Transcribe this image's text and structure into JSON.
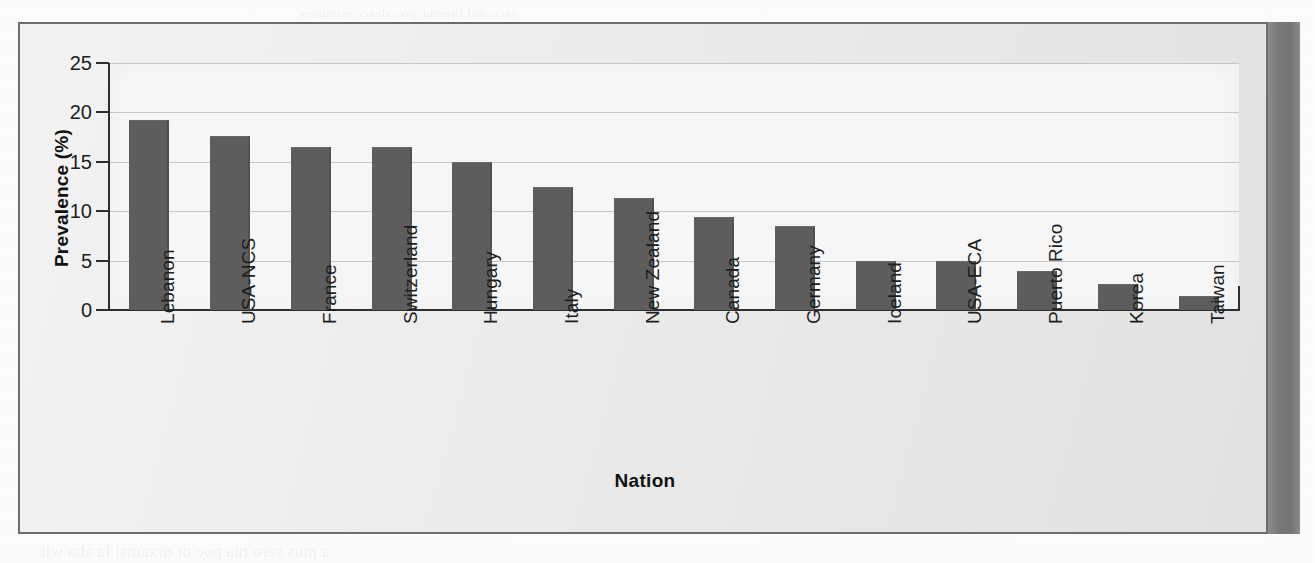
{
  "figure": {
    "panel_border_color": "#6d6d6d",
    "panel_background": "#e9e9e9",
    "plot_background": "#f6f6f6",
    "bar_color": "#5d5d5d",
    "gridline_color": "#c7c7c7",
    "axis_color": "#2f2f2f"
  },
  "bleed_text": {
    "line1": "a mus sero tua poe ot orxamsi la aba wit",
    "line2": "recorded lifetime prevalence estimates"
  },
  "chart_data": {
    "type": "bar",
    "title": "",
    "xlabel": "Nation",
    "ylabel": "Prevalence (%)",
    "ylim": [
      0,
      25
    ],
    "yticks": [
      0,
      5,
      10,
      15,
      20,
      25
    ],
    "ytick_labels": [
      "0",
      "5",
      "10",
      "15",
      "20",
      "25"
    ],
    "grid": "horizontal",
    "legend": "none",
    "categories": [
      "Lebanon",
      "USA-NCS",
      "France",
      "Switzerland",
      "Hungary",
      "Italy",
      "New Zealand",
      "Canada",
      "Germany",
      "Iceland",
      "USA-ECA",
      "Puerto Rico",
      "Korea",
      "Taiwan"
    ],
    "values": [
      19.2,
      17.6,
      16.5,
      16.5,
      15.0,
      12.4,
      11.3,
      9.4,
      8.5,
      5.0,
      5.0,
      3.9,
      2.6,
      1.4
    ]
  }
}
